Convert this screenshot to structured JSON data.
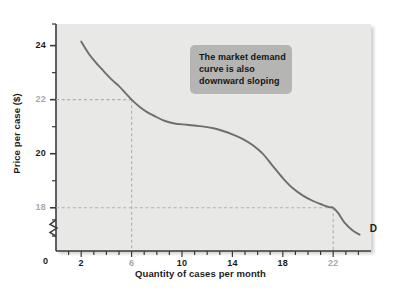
{
  "figure": {
    "title": "",
    "curve_label": "D",
    "callout": {
      "lines": [
        "The market demand",
        "curve is also",
        "downward sloping"
      ],
      "line1": "The market demand",
      "line2": "curve is also",
      "line3": "downward sloping",
      "bg_color": "#b5b5b3"
    },
    "colors": {
      "plot_background": "#e8e8e6",
      "page_background": "#ffffff",
      "curve": "#6e6e6e",
      "axis": "#3a3a3a",
      "dashed_guide": "#b0b0b0",
      "text": "#1b1b1b",
      "muted_text": "#a9a9a9"
    }
  },
  "chart_data": {
    "type": "line",
    "title": "",
    "subtitle": "",
    "xlabel": "Quantity of cases per month",
    "ylabel": "Price per case ($)",
    "xlim": [
      0,
      25
    ],
    "ylim": [
      16.4,
      24.8
    ],
    "grid": false,
    "legend": "none",
    "x_ticks_major": [
      2,
      6,
      10,
      14,
      18,
      22
    ],
    "x_tick_labels": [
      "2",
      "6",
      "10",
      "14",
      "18",
      "22"
    ],
    "x_tick_label_muted": [
      "6",
      "22"
    ],
    "x_origin_label": "0",
    "x_ticks_minor_step": 1,
    "y_ticks_major": [
      18,
      20,
      22,
      24
    ],
    "y_tick_labels": [
      "18",
      "20",
      "22",
      "24"
    ],
    "y_tick_label_muted": [
      "18",
      "22"
    ],
    "y_ticks_minor": [
      19,
      21,
      23
    ],
    "y_axis_break": true,
    "guides": [
      {
        "name": "guide-22-6",
        "price": 22,
        "quantity": 6
      },
      {
        "name": "guide-18-22",
        "price": 18,
        "quantity": 22
      }
    ],
    "series": [
      {
        "name": "D",
        "label": "D",
        "color": "#6e6e6e",
        "points": [
          {
            "x": 2.0,
            "y": 24.15
          },
          {
            "x": 2.6,
            "y": 23.7
          },
          {
            "x": 3.2,
            "y": 23.35
          },
          {
            "x": 3.8,
            "y": 23.05
          },
          {
            "x": 4.4,
            "y": 22.75
          },
          {
            "x": 5.0,
            "y": 22.5
          },
          {
            "x": 5.5,
            "y": 22.25
          },
          {
            "x": 6.0,
            "y": 22.0
          },
          {
            "x": 6.6,
            "y": 21.75
          },
          {
            "x": 7.2,
            "y": 21.55
          },
          {
            "x": 7.8,
            "y": 21.4
          },
          {
            "x": 8.6,
            "y": 21.22
          },
          {
            "x": 9.4,
            "y": 21.12
          },
          {
            "x": 10.4,
            "y": 21.07
          },
          {
            "x": 11.4,
            "y": 21.02
          },
          {
            "x": 12.4,
            "y": 20.95
          },
          {
            "x": 13.2,
            "y": 20.85
          },
          {
            "x": 14.0,
            "y": 20.72
          },
          {
            "x": 14.8,
            "y": 20.55
          },
          {
            "x": 15.6,
            "y": 20.32
          },
          {
            "x": 16.4,
            "y": 20.0
          },
          {
            "x": 17.2,
            "y": 19.55
          },
          {
            "x": 18.0,
            "y": 19.1
          },
          {
            "x": 18.8,
            "y": 18.72
          },
          {
            "x": 19.6,
            "y": 18.45
          },
          {
            "x": 20.4,
            "y": 18.25
          },
          {
            "x": 21.2,
            "y": 18.1
          },
          {
            "x": 21.7,
            "y": 18.02
          },
          {
            "x": 22.0,
            "y": 18.0
          },
          {
            "x": 22.4,
            "y": 17.8
          },
          {
            "x": 22.9,
            "y": 17.45
          },
          {
            "x": 23.5,
            "y": 17.18
          },
          {
            "x": 24.1,
            "y": 17.0
          }
        ]
      }
    ],
    "annotations": [
      {
        "name": "callout-market-demand",
        "text": "The market demand curve is also downward sloping"
      },
      {
        "name": "curve-end-label",
        "text": "D"
      }
    ]
  }
}
